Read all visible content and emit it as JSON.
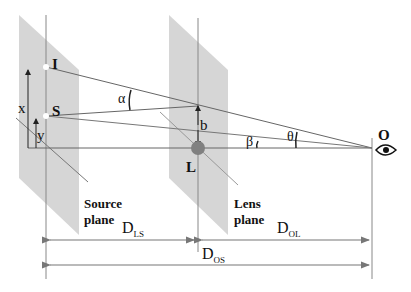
{
  "colors": {
    "plane_fill": "#d4d4d4",
    "line": "#666666",
    "lens_dot": "#808080",
    "text": "#111111"
  },
  "points": {
    "image": {
      "label": "I"
    },
    "source": {
      "label": "S"
    },
    "lens": {
      "label": "L"
    },
    "observer": {
      "label": "O",
      "icon": "eye-icon"
    }
  },
  "heights": {
    "x": "x",
    "y": "y",
    "b": "b"
  },
  "angles": {
    "alpha": "α",
    "beta": "β",
    "theta": "θ"
  },
  "planes": {
    "source": {
      "line1": "Source",
      "line2": "plane"
    },
    "lens": {
      "line1": "Lens",
      "line2": "plane"
    }
  },
  "distances": {
    "ls": {
      "main": "D",
      "sub": "LS"
    },
    "ol": {
      "main": "D",
      "sub": "OL"
    },
    "os": {
      "main": "D",
      "sub": "OS"
    }
  }
}
